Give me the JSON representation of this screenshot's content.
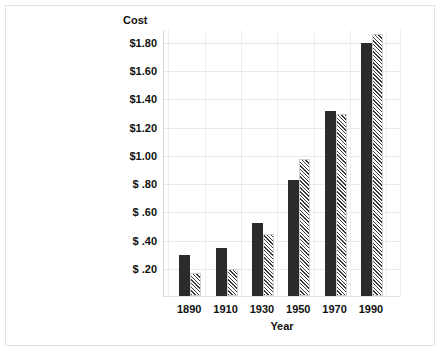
{
  "chart_data": {
    "type": "bar",
    "title": "",
    "xlabel": "Year",
    "ylabel": "Cost",
    "categories": [
      "1890",
      "1910",
      "1930",
      "1950",
      "1970",
      "1990"
    ],
    "series": [
      {
        "name": "solid",
        "values": [
          0.29,
          0.34,
          0.52,
          0.82,
          1.31,
          1.79
        ]
      },
      {
        "name": "hatched",
        "values": [
          0.16,
          0.19,
          0.44,
          0.97,
          1.29,
          1.86
        ]
      }
    ],
    "ylim": [
      0,
      1.8
    ],
    "ytick_values": [
      1.8,
      1.6,
      1.4,
      1.2,
      1.0,
      0.8,
      0.6,
      0.4,
      0.2
    ],
    "ytick_labels": [
      "$1.80",
      "$1.60",
      "$1.40",
      "$1.20",
      "$1.00",
      "$ .80",
      "$ .60",
      "$ .40",
      "$ .20"
    ],
    "grid": true,
    "legend": "none",
    "colors": {
      "solid_bar": "#2b2b2b",
      "hatched_bar": "#3a3a3a",
      "gridline": "#e9e9e9",
      "frame": "#e2e2e2",
      "text": "#111111"
    }
  }
}
